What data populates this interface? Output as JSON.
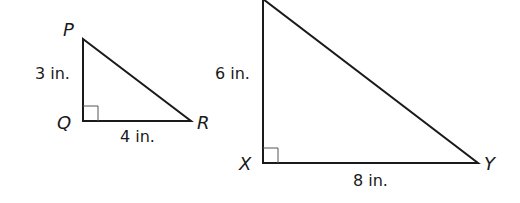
{
  "figure": {
    "triangle_pqr": {
      "vertices": {
        "p": "P",
        "q": "Q",
        "r": "R"
      },
      "sides": {
        "pq": "3 in.",
        "qr": "4 in."
      },
      "right_angle_at": "Q"
    },
    "triangle_xyz": {
      "vertices": {
        "x": "X",
        "y": "Y"
      },
      "sides": {
        "vertical": "6 in.",
        "xy": "8 in."
      },
      "right_angle_at": "X"
    },
    "colors": {
      "stroke": "#1a1a1a",
      "background": "#ffffff"
    }
  }
}
